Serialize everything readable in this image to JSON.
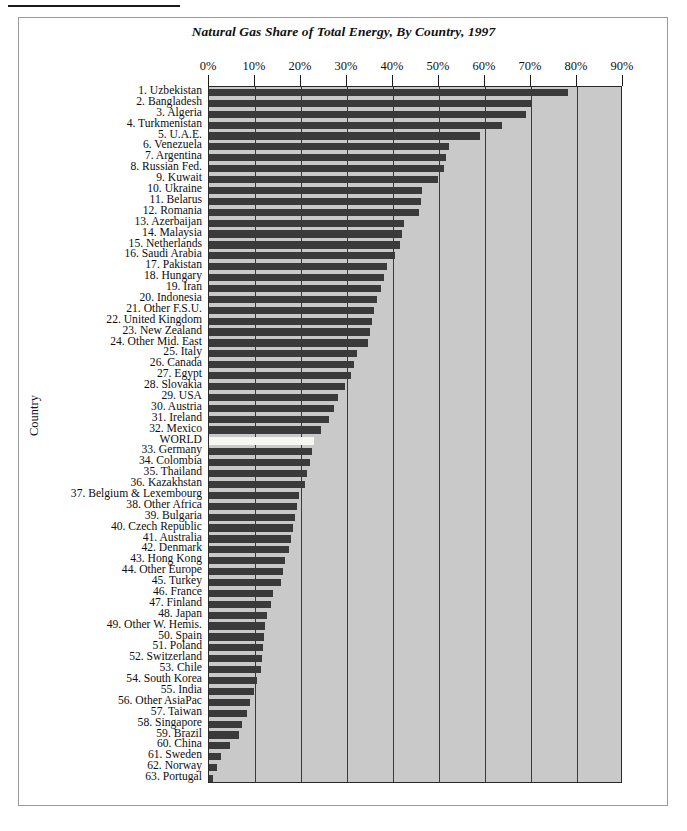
{
  "figure": {
    "title": "Natural Gas Share of Total Energy, By Country, 1997",
    "y_axis_title": "Country"
  },
  "chart_data": {
    "type": "bar",
    "orientation": "horizontal",
    "title": "Natural Gas Share of Total Energy, By Country, 1997",
    "xlabel": "",
    "ylabel": "Country",
    "xlim": [
      0,
      90
    ],
    "x_unit": "percent",
    "grid": true,
    "legend": null,
    "xticks": [
      0,
      10,
      20,
      30,
      40,
      50,
      60,
      70,
      80,
      90
    ],
    "xtick_labels": [
      "0%",
      "10%",
      "20%",
      "30%",
      "40%",
      "50%",
      "60%",
      "70%",
      "80%",
      "90%"
    ],
    "highlight_category": "WORLD",
    "highlight_color": "#f7f7f2",
    "bar_color": "#3a3a3a",
    "plot_background": "#c9c9c9",
    "categories": [
      "1. Uzbekistan",
      "2. Bangladesh",
      "3. Algeria",
      "4. Turkmenistan",
      "5. U.A.E.",
      "6. Venezuela",
      "7. Argentina",
      "8. Russian Fed.",
      "9. Kuwait",
      "10. Ukraine",
      "11. Belarus",
      "12. Romania",
      "13. Azerbaijan",
      "14. Malaysia",
      "15. Netherlands",
      "16. Saudi Arabia",
      "17. Pakistan",
      "18. Hungary",
      "19. Iran",
      "20. Indonesia",
      "21. Other F.S.U.",
      "22. United Kingdom",
      "23. New Zealand",
      "24. Other Mid. East",
      "25. Italy",
      "26. Canada",
      "27. Egypt",
      "28. Slovakia",
      "29. USA",
      "30. Austria",
      "31. Ireland",
      "32. Mexico",
      "WORLD",
      "33. Germany",
      "34. Colombia",
      "35. Thailand",
      "36. Kazakhstan",
      "37. Belgium & Lexembourg",
      "38. Other Africa",
      "39. Bulgaria",
      "40. Czech Republic",
      "41. Australia",
      "42. Denmark",
      "43. Hong Kong",
      "44. Other Europe",
      "45. Turkey",
      "46. France",
      "47. Finland",
      "48. Japan",
      "49. Other W. Hemis.",
      "50. Spain",
      "51. Poland",
      "52. Switzerland",
      "53. Chile",
      "54. South Korea",
      "55. India",
      "56. Other AsiaPac",
      "57. Taiwan",
      "58. Singapore",
      "59. Brazil",
      "60. China",
      "61. Sweden",
      "62. Norway",
      "63. Portugal"
    ],
    "values": [
      78.0,
      70.2,
      69.0,
      63.8,
      59.0,
      52.2,
      51.5,
      51.0,
      49.8,
      46.4,
      46.0,
      45.6,
      42.4,
      42.0,
      41.6,
      40.4,
      38.6,
      38.0,
      37.4,
      36.6,
      35.8,
      35.4,
      35.0,
      34.6,
      32.2,
      31.6,
      30.8,
      29.6,
      28.0,
      27.2,
      26.0,
      24.4,
      22.8,
      22.4,
      22.0,
      21.4,
      20.8,
      19.6,
      19.2,
      18.6,
      18.2,
      17.8,
      17.4,
      16.6,
      16.0,
      15.6,
      14.0,
      13.4,
      12.6,
      12.2,
      12.0,
      11.8,
      11.6,
      11.4,
      10.4,
      9.8,
      9.0,
      8.2,
      7.2,
      6.6,
      4.6,
      2.6,
      1.8,
      0.8
    ]
  }
}
